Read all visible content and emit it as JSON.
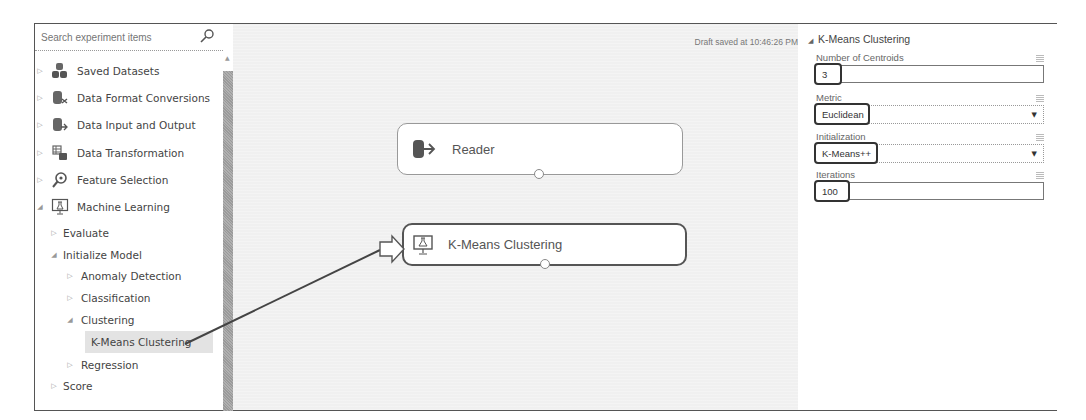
{
  "search": {
    "placeholder": "Search experiment items"
  },
  "sidebar": {
    "items": [
      {
        "label": "Saved Datasets",
        "icon": "saved-datasets-icon",
        "expanded": false
      },
      {
        "label": "Data Format Conversions",
        "icon": "data-format-conversions-icon",
        "expanded": false
      },
      {
        "label": "Data Input and Output",
        "icon": "data-input-output-icon",
        "expanded": false
      },
      {
        "label": "Data Transformation",
        "icon": "data-transformation-icon",
        "expanded": false
      },
      {
        "label": "Feature Selection",
        "icon": "feature-selection-icon",
        "expanded": false
      },
      {
        "label": "Machine Learning",
        "icon": "machine-learning-icon",
        "expanded": true
      },
      {
        "label": "Evaluate",
        "expanded": false
      },
      {
        "label": "Initialize Model",
        "expanded": true
      },
      {
        "label": "Anomaly Detection",
        "expanded": false
      },
      {
        "label": "Classification",
        "expanded": false
      },
      {
        "label": "Clustering",
        "expanded": true
      },
      {
        "label": "K-Means Clustering",
        "selected": true
      },
      {
        "label": "Regression",
        "expanded": false
      },
      {
        "label": "Score",
        "expanded": false
      }
    ]
  },
  "canvas": {
    "draft_status": "Draft saved at 10:46:26 PM",
    "modules": [
      {
        "label": "Reader",
        "icon": "reader-icon"
      },
      {
        "label": "K-Means Clustering",
        "icon": "kmeans-icon",
        "selected": true
      }
    ]
  },
  "properties": {
    "title": "K-Means Clustering",
    "fields": [
      {
        "label": "Number of Centroids",
        "type": "text",
        "value": "3"
      },
      {
        "label": "Metric",
        "type": "select",
        "value": "Euclidean"
      },
      {
        "label": "Initialization",
        "type": "select",
        "value": "K-Means++"
      },
      {
        "label": "Iterations",
        "type": "text",
        "value": "100"
      }
    ]
  },
  "colors": {
    "canvas_bg": "#f0f0f0",
    "highlight_border": "#333333",
    "selected_item_bg": "#e3e3e3"
  }
}
